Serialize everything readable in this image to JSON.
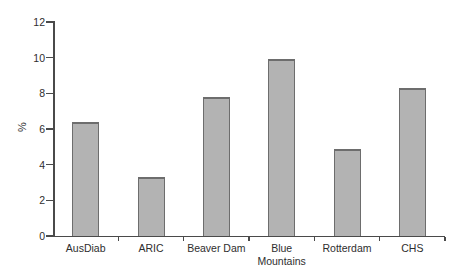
{
  "chart_data": {
    "type": "bar",
    "title": "",
    "xlabel": "",
    "ylabel": "%",
    "categories": [
      "AusDiab",
      "ARIC",
      "Beaver Dam",
      "Blue Mountains",
      "Rotterdam",
      "CHS"
    ],
    "category_label_lines": [
      [
        "AusDiab"
      ],
      [
        "ARIC"
      ],
      [
        "Beaver Dam"
      ],
      [
        "Blue",
        "Mountains"
      ],
      [
        "Rotterdam"
      ],
      [
        "CHS"
      ]
    ],
    "values": [
      6.4,
      3.3,
      7.8,
      9.9,
      4.9,
      8.3
    ],
    "ylim": [
      0,
      12
    ],
    "yticks": [
      0,
      2,
      4,
      6,
      8,
      10,
      12
    ],
    "grid": false,
    "legend": null,
    "colors": {
      "bar_fill": "#b3b3b3",
      "bar_border": "#6d6d6d",
      "axis": "#4a4a4a",
      "text": "#2e2e2e",
      "background": "#ffffff"
    }
  }
}
